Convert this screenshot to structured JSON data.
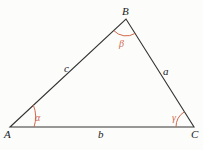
{
  "diagram": {
    "type": "triangle",
    "vertices": [
      {
        "id": "A",
        "label": "A",
        "x": 10,
        "y": 127
      },
      {
        "id": "B",
        "label": "B",
        "x": 126,
        "y": 19
      },
      {
        "id": "C",
        "label": "C",
        "x": 194,
        "y": 127
      }
    ],
    "sides": [
      {
        "id": "a",
        "label": "a",
        "between": [
          "B",
          "C"
        ]
      },
      {
        "id": "b",
        "label": "b",
        "between": [
          "A",
          "C"
        ]
      },
      {
        "id": "c",
        "label": "c",
        "between": [
          "A",
          "B"
        ]
      }
    ],
    "angles": [
      {
        "id": "alpha",
        "label": "α",
        "vertex": "A"
      },
      {
        "id": "beta",
        "label": "β",
        "vertex": "B"
      },
      {
        "id": "gamma",
        "label": "γ",
        "vertex": "C"
      }
    ],
    "colors": {
      "line": "#333333",
      "angle": "#d0694a",
      "text": "#222222",
      "background": "#fcfcfb"
    }
  }
}
